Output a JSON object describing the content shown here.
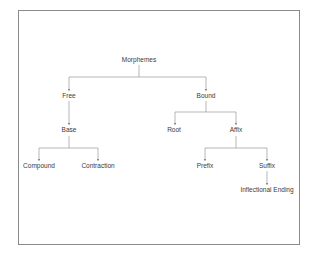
{
  "diagram": {
    "type": "tree",
    "root": "Morphemes",
    "nodes": {
      "morphemes": "Morphemes",
      "free": "Free",
      "bound": "Bound",
      "base": "Base",
      "root": "Root",
      "affix": "Affix",
      "compound": "Compound",
      "contraction": "Contraction",
      "prefix": "Prefix",
      "suffix": "Suffix",
      "inflectional_ending": "Inflectional Ending"
    },
    "edges": [
      [
        "Morphemes",
        "Free"
      ],
      [
        "Morphemes",
        "Bound"
      ],
      [
        "Free",
        "Base"
      ],
      [
        "Base",
        "Compound"
      ],
      [
        "Base",
        "Contraction"
      ],
      [
        "Bound",
        "Root"
      ],
      [
        "Bound",
        "Affix"
      ],
      [
        "Affix",
        "Prefix"
      ],
      [
        "Affix",
        "Suffix"
      ],
      [
        "Suffix",
        "Inflectional Ending"
      ]
    ],
    "colors": {
      "line": "#9a9a9a",
      "text": "#3a3a3a",
      "frame": "#8a8a8a"
    }
  }
}
